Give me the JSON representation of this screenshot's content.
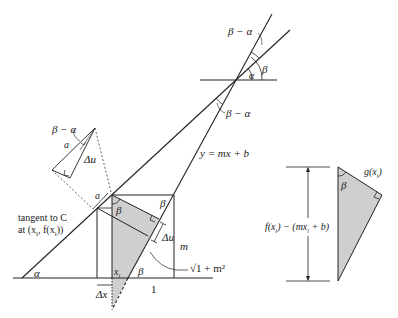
{
  "figure": {
    "colors": {
      "line": "#222222",
      "shade": "#cfcfcf",
      "background": "#ffffff"
    }
  },
  "labels": {
    "top_beta_minus_alpha": "β − α",
    "top_alpha": "α",
    "top_beta": "β",
    "mid_beta_minus_alpha": "β − α",
    "line_equation": "y = mx + b",
    "inset_beta_minus_alpha": "β − α",
    "inset_a": "a",
    "inset_delta_u": "Δu",
    "a_label": "a",
    "beta_left_corner": "β",
    "beta_right_corner": "β",
    "tangent_line1": "tangent to C",
    "tangent_line2": "at (x",
    "tangent_line2_sub": "i",
    "tangent_line2_end": ", f(x",
    "tangent_line2_sub2": "i",
    "tangent_line2_close": "))",
    "delta_u": "Δu",
    "m_label": "m",
    "sqrt_label": "√1 + m²",
    "base_alpha": "α",
    "xi": "x",
    "xi_sub": "i",
    "base_beta": "β",
    "delta_x": "Δx",
    "one_label": "1",
    "right_beta": "β",
    "g_label": "g(x",
    "g_sub": "i",
    "g_close": ")",
    "f_label": "f(x",
    "f_sub": "i",
    "f_mid": ") − (mx",
    "f_sub2": "i",
    "f_end": " + b)"
  }
}
